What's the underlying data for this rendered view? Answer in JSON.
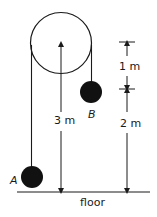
{
  "diagram": {
    "labels": {
      "ball_a": "A",
      "ball_b": "B",
      "height_center": "3 m",
      "dim_upper": "1 m",
      "dim_lower": "2 m",
      "floor": "floor"
    },
    "colors": {
      "line": "#1a1a1a",
      "ball": "#111111",
      "background": "#ffffff"
    }
  }
}
